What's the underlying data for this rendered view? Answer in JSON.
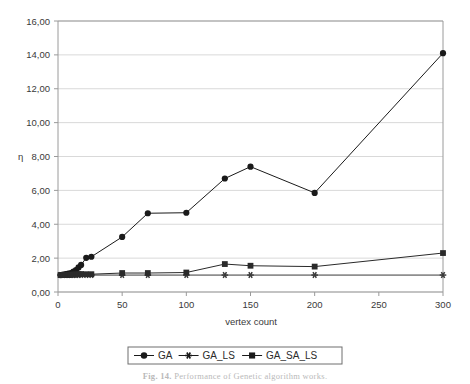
{
  "figure": {
    "caption_prefix": "Fig. 14.",
    "caption_text": "Performance of Genetic algorithm works.",
    "background_color": "#ffffff"
  },
  "chart_data": {
    "type": "line",
    "title": "",
    "xlabel": "vertex count",
    "ylabel": "η",
    "xlim": [
      0,
      300
    ],
    "ylim": [
      0,
      16
    ],
    "xticks": [
      0,
      50,
      100,
      150,
      200,
      250,
      300
    ],
    "xtick_labels": [
      "0",
      "50",
      "100",
      "150",
      "200",
      "250",
      "300"
    ],
    "yticks": [
      0,
      2,
      4,
      6,
      8,
      10,
      12,
      14,
      16
    ],
    "ytick_labels": [
      "0,00",
      "2,00",
      "4,00",
      "6,00",
      "8,00",
      "10,00",
      "12,00",
      "14,00",
      "16,00"
    ],
    "grid": "horizontal",
    "grid_color": "#d9d9d9",
    "axis_color": "#9a9a9a",
    "plot_border": true,
    "legend_position": "bottom-center",
    "decimal_separator": ",",
    "series": [
      {
        "name": "GA",
        "marker": "circle",
        "color": "#1a1a1a",
        "x": [
          2,
          4,
          6,
          8,
          10,
          12,
          14,
          16,
          18,
          22,
          26,
          50,
          70,
          100,
          130,
          150,
          200,
          300
        ],
        "values": [
          1.0,
          1.02,
          1.05,
          1.08,
          1.12,
          1.2,
          1.3,
          1.45,
          1.6,
          2.02,
          2.08,
          3.25,
          4.65,
          4.68,
          6.7,
          7.4,
          5.85,
          14.1
        ]
      },
      {
        "name": "GA_LS",
        "marker": "asterisk",
        "color": "#3a3a3a",
        "x": [
          2,
          4,
          6,
          8,
          10,
          12,
          14,
          16,
          18,
          22,
          26,
          50,
          70,
          100,
          130,
          150,
          200,
          300
        ],
        "values": [
          1.0,
          1.0,
          1.0,
          1.0,
          1.0,
          1.0,
          1.0,
          1.0,
          1.0,
          1.0,
          1.0,
          1.0,
          1.0,
          1.0,
          1.0,
          1.0,
          1.0,
          1.0
        ]
      },
      {
        "name": "GA_SA_LS",
        "marker": "square",
        "color": "#2a2a2a",
        "x": [
          2,
          4,
          6,
          8,
          10,
          12,
          14,
          16,
          18,
          22,
          26,
          50,
          70,
          100,
          130,
          150,
          200,
          300
        ],
        "values": [
          1.0,
          1.0,
          1.0,
          1.0,
          1.02,
          1.03,
          1.04,
          1.05,
          1.06,
          1.05,
          1.05,
          1.12,
          1.12,
          1.15,
          1.65,
          1.55,
          1.5,
          2.3
        ]
      }
    ],
    "legend_entries": [
      {
        "label": "GA",
        "marker": "circle"
      },
      {
        "label": "GA_LS",
        "marker": "asterisk"
      },
      {
        "label": "GA_SA_LS",
        "marker": "square"
      }
    ]
  }
}
